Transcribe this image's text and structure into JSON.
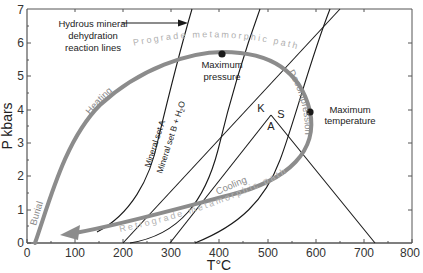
{
  "figure": {
    "title": "",
    "x_axis": {
      "label": "T°C",
      "ticks": [
        "0",
        "100",
        "200",
        "300",
        "400",
        "500",
        "600",
        "700",
        "800"
      ],
      "range": [
        0,
        800
      ]
    },
    "y_axis": {
      "label": "P kbars",
      "ticks": [
        "0",
        "1",
        "2",
        "3",
        "4",
        "5",
        "6",
        "7"
      ],
      "range": [
        0,
        7
      ]
    },
    "annotations": {
      "reaction_lines_line1": "Hydrous mineral",
      "reaction_lines_line2": "dehydration",
      "reaction_lines_line3": "reaction lines",
      "max_pressure_line1": "Maximum",
      "max_pressure_line2": "pressure",
      "max_temperature_line1": "Maximum",
      "max_temperature_line2": "temperature",
      "mineral_set_a": "Mineral set A",
      "mineral_set_b": "Mineral set B + H",
      "h2o_sub": "2",
      "h2o_o": "O",
      "field_k": "K",
      "field_s": "S",
      "field_a": "A"
    },
    "path_labels": {
      "burial": "Burial",
      "heating": "Heating",
      "prograde": "Prograde metamorphic path",
      "decompression": "Decompression",
      "cooling": "Cooling",
      "retrograde": "Retrograde metamorphic path"
    },
    "key_points": [
      {
        "name": "Maximum pressure",
        "T": 405,
        "P": 5.65
      },
      {
        "name": "Maximum temperature",
        "T": 590,
        "P": 3.95
      }
    ],
    "colors": {
      "pt_path": "#8c8c8c",
      "reaction_lines": "#1a1a1a",
      "path_text": "#b0b0b0"
    }
  }
}
